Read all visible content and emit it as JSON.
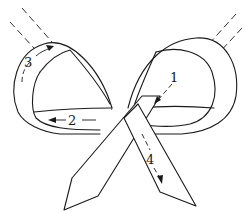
{
  "diagram": {
    "colors": {
      "line": "#1a1a1a",
      "background": "#ffffff"
    },
    "steps": [
      {
        "label": "1",
        "description": "arrow pointing down-left inside right loop"
      },
      {
        "label": "2",
        "description": "arrow pointing left across bottom of left loop"
      },
      {
        "label": "3",
        "description": "arrow curving up-right along outer left loop"
      },
      {
        "label": "4",
        "description": "dashed arrow pointing down along right tail"
      }
    ]
  }
}
